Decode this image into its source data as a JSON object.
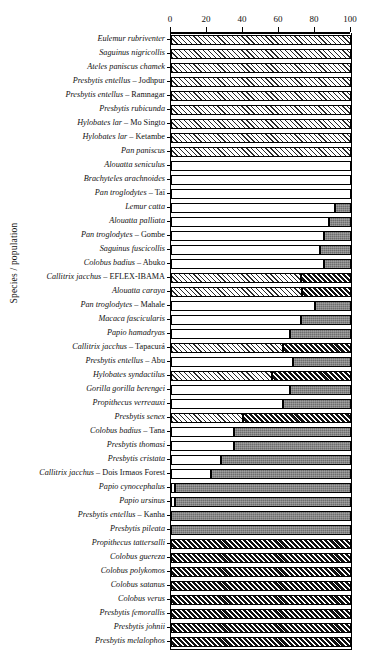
{
  "chart_data": {
    "type": "bar",
    "orientation": "horizontal",
    "stacked": true,
    "title": "",
    "xlabel": "",
    "ylabel": "Species / population",
    "xlim": [
      0,
      100
    ],
    "xticks": [
      0,
      20,
      40,
      60,
      80,
      100
    ],
    "xtick_labels": [
      "0",
      "20",
      "40",
      "60",
      "80",
      "100"
    ],
    "grid": false,
    "legend": null,
    "series": [
      {
        "name": "segment-1",
        "pattern": "white-or-light-hatch"
      },
      {
        "name": "segment-2",
        "pattern": "gray-or-black-hatch"
      }
    ],
    "categories": [
      "Eulemur rubriventer",
      "Saguinus nigricollis",
      "Ateles paniscus chamek",
      "Presbytis entellus – Jodhpur",
      "Presbytis entellus – Ramnagar",
      "Presbytis rubicunda",
      "Hylobates lar – Mo Singto",
      "Hylobates lar – Ketambe",
      "Pan paniscus",
      "Alouatta seniculus",
      "Brachyteles arachnoides",
      "Pan troglodytes – Taï",
      "Lemur catta",
      "Alouatta palliata",
      "Pan troglodytes – Gombe",
      "Saguinus fuscicollis",
      "Colobus badius – Abuko",
      "Callitrix jacchus – EFLEX-IBAMA",
      "Alouatta caraya",
      "Pan troglodytes – Mahale",
      "Macaca fascicularis",
      "Papio hamadryas",
      "Callitrix jacchus – Tapacurá",
      "Presbytis entellus – Abu",
      "Hylobates syndactilus",
      "Gorilla gorilla berengei",
      "Propithecus verreauxi",
      "Presbytis senex",
      "Colobus badius – Tana",
      "Presbytis thomasi",
      "Presbytis cristata",
      "Callitrix jacchus – Dois Irmaos Forest",
      "Papio cynocephalus",
      "Papio ursinus",
      "Presbytis entellus – Kanha",
      "Presbytis pileata",
      "Propithecus tattersalli",
      "Colobus guereza",
      "Colobus polykomos",
      "Colobus satanus",
      "Colobus verus",
      "Presbytis femorallis",
      "Presbytis johnii",
      "Presbytis melalophos"
    ],
    "values_segment1": [
      100,
      100,
      100,
      100,
      100,
      100,
      100,
      100,
      100,
      100,
      100,
      100,
      91,
      88,
      85,
      83,
      85,
      72,
      73,
      80,
      72,
      66,
      62,
      68,
      56,
      66,
      62,
      40,
      35,
      35,
      28,
      22,
      2,
      2,
      0,
      0,
      0,
      0,
      0,
      0,
      0,
      0,
      0,
      0
    ],
    "values_segment2": [
      0,
      0,
      0,
      0,
      0,
      0,
      0,
      0,
      0,
      0,
      0,
      0,
      9,
      12,
      15,
      17,
      15,
      28,
      27,
      20,
      28,
      34,
      38,
      32,
      44,
      34,
      38,
      60,
      65,
      65,
      72,
      78,
      98,
      98,
      100,
      100,
      100,
      100,
      100,
      100,
      100,
      100,
      100,
      100
    ],
    "styles": [
      "hatch",
      "hatch",
      "hatch",
      "hatch",
      "hatch",
      "hatch",
      "hatch",
      "hatch",
      "hatch",
      "solid",
      "solid",
      "solid",
      "solid",
      "solid",
      "solid",
      "solid",
      "solid",
      "hatch",
      "hatch",
      "solid",
      "solid",
      "solid",
      "hatch",
      "solid",
      "hatch",
      "solid",
      "solid",
      "hatch",
      "solid",
      "solid",
      "solid",
      "solid",
      "solid",
      "solid",
      "solid",
      "solid",
      "hatch",
      "hatch",
      "hatch",
      "hatch",
      "hatch",
      "hatch",
      "hatch",
      "hatch"
    ]
  }
}
